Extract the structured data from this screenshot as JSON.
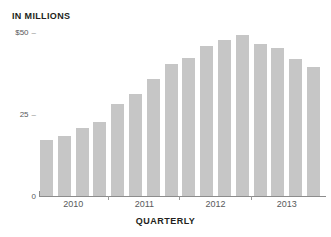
{
  "figure": {
    "top_cropped_text": "",
    "unit_label": "IN MILLIONS",
    "axis_title": "QUARTERLY"
  },
  "colors": {
    "bar": "#c6c6c6",
    "axis": "#8c8c8c",
    "tick_text": "#58595b",
    "label_text": "#231f20",
    "background": "#ffffff"
  },
  "chart_data": {
    "type": "bar",
    "title": "",
    "subtitle": "",
    "xlabel": "QUARTERLY",
    "ylabel": "IN MILLIONS",
    "ylim": [
      0,
      50
    ],
    "ytick_labels": [
      "$50",
      "25",
      "0"
    ],
    "ytick_values": [
      50,
      25,
      0
    ],
    "grid": false,
    "legend": null,
    "xtick_labels": [
      "2010",
      "2011",
      "2012",
      "2013"
    ],
    "categories": [
      "2010 Q1",
      "2010 Q2",
      "2010 Q3",
      "2010 Q4",
      "2011 Q1",
      "2011 Q2",
      "2011 Q3",
      "2011 Q4",
      "2012 Q1",
      "2012 Q2",
      "2012 Q3",
      "2012 Q4",
      "2013 Q1",
      "2013 Q2",
      "2013 Q3",
      "2013 Q4"
    ],
    "values": [
      17.5,
      18.5,
      21,
      23,
      28.5,
      31.5,
      36,
      40.5,
      42.5,
      46,
      48,
      49.5,
      46.5,
      45.5,
      42,
      39.5
    ],
    "units": "millions of dollars"
  }
}
